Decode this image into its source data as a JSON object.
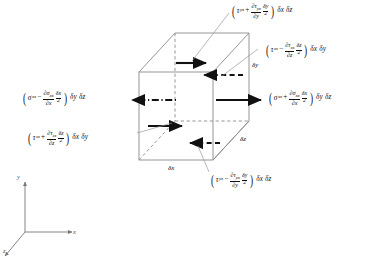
{
  "figure": {
    "background_color": "#ffffff",
    "line_color": "#8a8a8a",
    "arrow_color": "#111111",
    "text_color": "#111111"
  },
  "cube": {
    "dimension_labels": [
      {
        "name": "delta-x",
        "text": "δx"
      },
      {
        "name": "delta-y",
        "text": "δy"
      },
      {
        "name": "delta-z",
        "text": "δz"
      }
    ]
  },
  "axes": {
    "x_label": "x",
    "y_label": "y",
    "z_label": "z"
  },
  "labels": {
    "top_tau_yx_plus": {
      "open": "(",
      "base_symbol": "τ",
      "base_sub": "yx",
      "operator": "+",
      "frac1_num_d": "∂τ",
      "frac1_num_sub": "yx",
      "frac1_den_d": "∂y",
      "frac2_num": "δy",
      "frac2_den": "2",
      "close": ")",
      "tail": "δx δz",
      "full_text": "(τyx + ∂τyx/∂y · δy/2) δx δz"
    },
    "right_tau_zx_minus": {
      "open": "(",
      "base_symbol": "τ",
      "base_sub": "zx",
      "operator": "−",
      "frac1_num_d": "∂τ",
      "frac1_num_sub": "zx",
      "frac1_den_d": "∂z",
      "frac2_num": "δz",
      "frac2_den": "2",
      "close": ")",
      "tail": "δx δy",
      "full_text": "(τzx − ∂τzx/∂z · δz/2) δx δy"
    },
    "left_sigma_xx_minus": {
      "open": "(",
      "base_symbol": "σ",
      "base_sub": "xx",
      "operator": "−",
      "frac1_num_d": "∂σ",
      "frac1_num_sub": "xx",
      "frac1_den_d": "∂x",
      "frac2_num": "δx",
      "frac2_den": "2",
      "close": ")",
      "tail": "δy δz",
      "full_text": "(σxx − ∂σxx/∂x · δx/2) δy δz"
    },
    "right_sigma_xx_plus": {
      "open": "(",
      "base_symbol": "σ",
      "base_sub": "xx",
      "operator": "+",
      "frac1_num_d": "∂σ",
      "frac1_num_sub": "xx",
      "frac1_den_d": "∂x",
      "frac2_num": "δx",
      "frac2_den": "2",
      "close": ")",
      "tail": "δy δz",
      "full_text": "(σxx + ∂σxx/∂x · δx/2) δy δz"
    },
    "lower_left_tau_zx_plus": {
      "open": "(",
      "base_symbol": "τ",
      "base_sub": "zx",
      "operator": "+",
      "frac1_num_d": "∂τ",
      "frac1_num_sub": "zx",
      "frac1_den_d": "∂z",
      "frac2_num": "δz",
      "frac2_den": "2",
      "close": ")",
      "tail": "δx δy",
      "full_text": "(τzx + ∂τzx/∂z · δz/2) δx δy"
    },
    "bottom_tau_yx_minus": {
      "open": "(",
      "base_symbol": "τ",
      "base_sub": "yx",
      "operator": "−",
      "frac1_num_d": "∂τ",
      "frac1_num_sub": "yx",
      "frac1_den_d": "∂y",
      "frac2_num": "δy",
      "frac2_den": "2",
      "close": ")",
      "tail": "δx δz",
      "full_text": "(τyx − ∂τyx/∂y · δy/2) δx δz"
    }
  }
}
